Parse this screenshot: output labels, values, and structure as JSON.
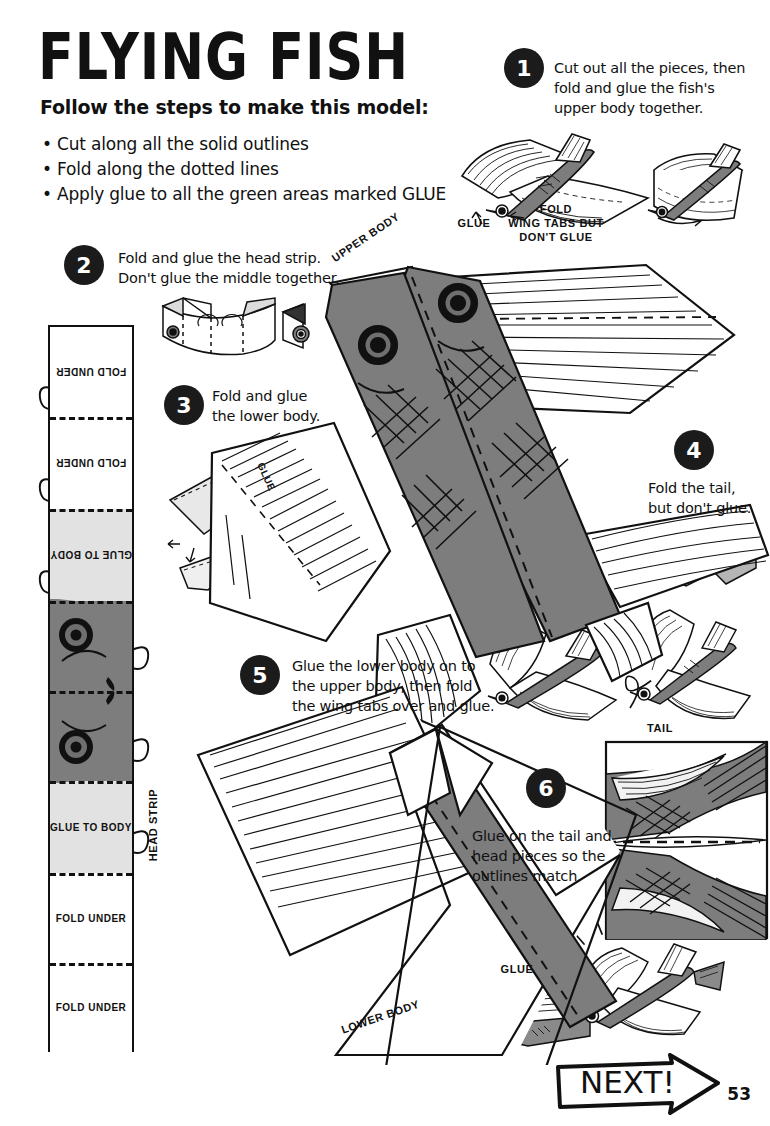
{
  "header": {
    "title": "FLYING FISH",
    "subtitle": "Follow the steps to make this model:",
    "bullets": [
      "Cut along all the solid outlines",
      "Fold along the dotted lines",
      "Apply glue to all the green areas marked GLUE"
    ]
  },
  "steps": [
    {
      "num": "1",
      "caption": "Cut out all the pieces, then\nfold and glue the fish's\nupper body together."
    },
    {
      "num": "2",
      "caption": "Fold and glue the head strip.\nDon't glue the middle together."
    },
    {
      "num": "3",
      "caption": "Fold and glue\nthe lower body."
    },
    {
      "num": "4",
      "caption": "Fold the tail,\nbut don't glue."
    },
    {
      "num": "5",
      "caption": "Glue the lower body on to\nthe upper body, then fold\nthe wing tabs over and glue."
    },
    {
      "num": "6",
      "caption": "Glue on the tail and\nhead pieces so the\noutlines match."
    }
  ],
  "labels": {
    "glue_step1": "GLUE",
    "fold_wing_tabs": "FOLD\nWING TABS BUT\nDON'T GLUE",
    "glue_step3": "GLUE",
    "glue_step6": "GLUE",
    "upper_body": "UPPER BODY",
    "lower_body": "LOWER BODY",
    "head_strip": "HEAD STRIP",
    "tail": "TAIL"
  },
  "head_strip": {
    "segments": [
      {
        "label": "FOLD UNDER",
        "type": "fold",
        "flipped": true
      },
      {
        "label": "FOLD UNDER",
        "type": "fold",
        "flipped": true
      },
      {
        "label": "GLUE TO BODY",
        "type": "glue",
        "flipped": true
      },
      {
        "label": "",
        "type": "fish",
        "flipped": true
      },
      {
        "label": "",
        "type": "fish",
        "flipped": false
      },
      {
        "label": "GLUE TO BODY",
        "type": "glue",
        "flipped": false
      },
      {
        "label": "FOLD UNDER",
        "type": "fold",
        "flipped": false
      },
      {
        "label": "FOLD UNDER",
        "type": "fold",
        "flipped": false
      }
    ]
  },
  "footer": {
    "next_label": "NEXT!",
    "page_number": "53"
  },
  "colors": {
    "ink": "#111111",
    "fish_body": "#7d7d7d",
    "glue_area": "#e2e2e2",
    "paper": "#ffffff",
    "bubble": "#1b1b1b"
  }
}
